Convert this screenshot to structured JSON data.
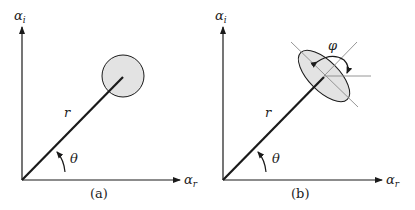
{
  "panels": [
    {
      "id": "a",
      "caption": "(a)",
      "y_axis_label": "α",
      "y_axis_sub": "i",
      "x_axis_label": "α",
      "x_axis_sub": "r",
      "radius_label": "r",
      "angle_label": "θ",
      "shape": "circle"
    },
    {
      "id": "b",
      "caption": "(b)",
      "y_axis_label": "α",
      "y_axis_sub": "i",
      "x_axis_label": "α",
      "x_axis_sub": "r",
      "radius_label": "r",
      "angle_label": "θ",
      "rotation_label": "φ",
      "shape": "ellipse"
    }
  ],
  "colors": {
    "stroke": "#1a1a1a",
    "fill": "#e3e3e3",
    "guide": "#8a8a8a"
  }
}
